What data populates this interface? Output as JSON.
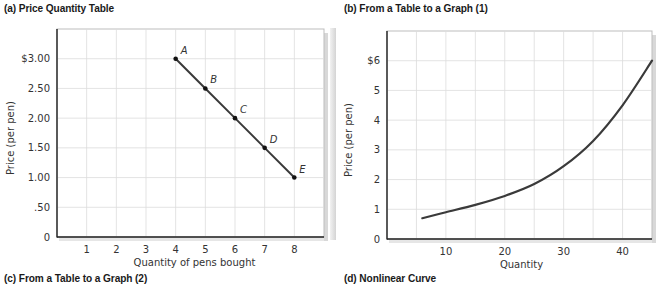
{
  "captions": {
    "a": "(a)  Price Quantity Table",
    "b": "(b)  From a Table to a Graph (1)",
    "c": "(c)  From a Table to a Graph (2)",
    "d": "(d)  Nonlinear Curve"
  },
  "colors": {
    "line": "#3a3a3a",
    "grid": "#dcdcdc",
    "axis": "#222222",
    "frame": "#bdbdbd"
  },
  "chart_data": [
    {
      "type": "line",
      "title": "",
      "xlabel": "Quantity of pens bought",
      "ylabel": "Price (per pen)",
      "x_ticks": [
        "1",
        "2",
        "3",
        "4",
        "5",
        "6",
        "7",
        "8"
      ],
      "y_ticks": [
        "0",
        ".50",
        "1.00",
        "1.50",
        "2.00",
        "2.50",
        "$3.00"
      ],
      "xlim": [
        0,
        9
      ],
      "ylim": [
        0,
        3.5
      ],
      "grid": true,
      "points": [
        {
          "label": "A",
          "x": 4,
          "y": 3.0
        },
        {
          "label": "B",
          "x": 5,
          "y": 2.5
        },
        {
          "label": "C",
          "x": 6,
          "y": 2.0
        },
        {
          "label": "D",
          "x": 7,
          "y": 1.5
        },
        {
          "label": "E",
          "x": 8,
          "y": 1.0
        }
      ]
    },
    {
      "type": "line",
      "title": "",
      "xlabel": "Quantity",
      "ylabel": "Price (per pen)",
      "x_ticks": [
        "10",
        "20",
        "30",
        "40"
      ],
      "y_ticks": [
        "0",
        "1",
        "2",
        "3",
        "4",
        "5",
        "$6"
      ],
      "xlim": [
        0,
        45
      ],
      "ylim": [
        0,
        7
      ],
      "grid": true,
      "x": [
        6,
        10,
        15,
        20,
        25,
        30,
        35,
        40,
        45
      ],
      "values": [
        0.7,
        0.9,
        1.15,
        1.45,
        1.85,
        2.45,
        3.3,
        4.5,
        6.0
      ]
    }
  ]
}
